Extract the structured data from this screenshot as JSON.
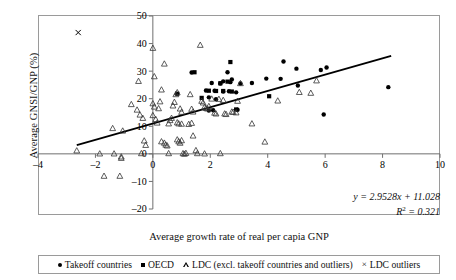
{
  "chart_data": {
    "type": "scatter",
    "title": "",
    "xlabel": "Average growth rate of real per capia GNP",
    "ylabel": "Average GNSI/GNP (%)",
    "xlim": [
      -4,
      10
    ],
    "ylim": [
      -20,
      50
    ],
    "xticks": [
      -4,
      -2,
      0,
      2,
      4,
      6,
      8,
      10
    ],
    "yticks": [
      -20,
      -10,
      0,
      10,
      20,
      30,
      40,
      50
    ],
    "xtick_labels": [
      "-4",
      "-2",
      "0",
      "2",
      "4",
      "6",
      "8",
      "10"
    ],
    "ytick_labels": [
      "-20",
      "-10",
      "0",
      "10",
      "20",
      "30",
      "40",
      "50"
    ],
    "grid": false,
    "legend_position": "below-plot",
    "annotations": {
      "equation": "y = 2.9528x + 11.028",
      "r_squared_label": "R",
      "r_squared_exp": "2",
      "r_squared_value": "= 0.321"
    },
    "trendline": {
      "slope": 2.9528,
      "intercept": 11.028,
      "x_start": -2.65,
      "x_end": 8.3
    },
    "series": [
      {
        "name": "Takeoff countries",
        "marker": "circle",
        "points": [
          [
            2.75,
            27.0
          ],
          [
            3.05,
            25.5
          ],
          [
            3.45,
            25.7
          ],
          [
            3.95,
            27.3
          ],
          [
            4.55,
            33.5
          ],
          [
            5.0,
            30.9
          ],
          [
            5.05,
            24.8
          ],
          [
            5.85,
            30.4
          ],
          [
            6.05,
            31.3
          ],
          [
            5.95,
            14.3
          ],
          [
            8.2,
            24.2
          ],
          [
            2.6,
            29.6
          ],
          [
            2.05,
            25.7
          ],
          [
            2.35,
            25.5
          ],
          [
            1.85,
            23.0
          ],
          [
            2.15,
            22.9
          ],
          [
            2.45,
            22.6
          ],
          [
            2.65,
            22.7
          ],
          [
            2.9,
            22.3
          ],
          [
            2.45,
            26.3
          ],
          [
            2.7,
            26.0
          ],
          [
            1.95,
            20.5
          ],
          [
            2.2,
            19.8
          ],
          [
            2.1,
            15.8
          ],
          [
            1.95,
            15.7
          ],
          [
            2.95,
            16.0
          ],
          [
            1.35,
            29.5
          ],
          [
            4.45,
            27.2
          ]
        ]
      },
      {
        "name": "OECD",
        "marker": "square",
        "points": [
          [
            2.7,
            33.3
          ],
          [
            1.45,
            29.6
          ],
          [
            0.85,
            21.8
          ],
          [
            1.7,
            20.3
          ],
          [
            4.05,
            20.9
          ],
          [
            2.9,
            16.1
          ],
          [
            2.45,
            22.8
          ],
          [
            2.75,
            22.6
          ],
          [
            1.95,
            22.9
          ],
          [
            2.2,
            22.8
          ],
          [
            2.35,
            25.6
          ],
          [
            2.6,
            26.2
          ]
        ]
      },
      {
        "name": "LDC (excl. takeoff countries and outliers)",
        "marker": "triangle",
        "points": [
          [
            -2.65,
            1.2
          ],
          [
            -1.85,
            0.1
          ],
          [
            -1.4,
            9.3
          ],
          [
            -1.35,
            0.1
          ],
          [
            -1.1,
            -1.5
          ],
          [
            -1.1,
            -1.0
          ],
          [
            -1.05,
            8.4
          ],
          [
            -1.15,
            -8.0
          ],
          [
            -1.7,
            -8.0
          ],
          [
            -0.35,
            13.0
          ],
          [
            -0.5,
            26.4
          ],
          [
            -0.75,
            18.0
          ],
          [
            -0.55,
            16.0
          ],
          [
            -0.45,
            14.2
          ],
          [
            -0.3,
            4.8
          ],
          [
            -0.25,
            3.2
          ],
          [
            -0.4,
            0.2
          ],
          [
            0.0,
            38.4
          ],
          [
            0.05,
            28.1
          ],
          [
            0.0,
            18.3
          ],
          [
            0.05,
            17.1
          ],
          [
            0.0,
            14.0
          ],
          [
            0.1,
            12.6
          ],
          [
            0.15,
            11.3
          ],
          [
            0.2,
            16.5
          ],
          [
            0.25,
            19.0
          ],
          [
            0.3,
            23.3
          ],
          [
            0.4,
            32.7
          ],
          [
            0.3,
            4.5
          ],
          [
            0.4,
            4.0
          ],
          [
            0.45,
            3.3
          ],
          [
            0.5,
            3.0
          ],
          [
            0.55,
            11.0
          ],
          [
            0.6,
            12.2
          ],
          [
            0.65,
            13.0
          ],
          [
            0.7,
            17.5
          ],
          [
            0.75,
            18.8
          ],
          [
            0.8,
            21.6
          ],
          [
            0.85,
            22.3
          ],
          [
            0.95,
            16.4
          ],
          [
            1.0,
            15.2
          ],
          [
            0.85,
            11.4
          ],
          [
            0.9,
            11.0
          ],
          [
            1.0,
            10.9
          ],
          [
            0.85,
            5.2
          ],
          [
            0.9,
            4.5
          ],
          [
            0.95,
            4.0
          ],
          [
            1.0,
            4.9
          ],
          [
            1.05,
            0.2
          ],
          [
            1.1,
            0.0
          ],
          [
            1.15,
            0.3
          ],
          [
            1.3,
            21.6
          ],
          [
            1.35,
            16.3
          ],
          [
            1.4,
            15.3
          ],
          [
            1.35,
            11.2
          ],
          [
            1.4,
            6.6
          ],
          [
            1.5,
            1.3
          ],
          [
            1.55,
            0.2
          ],
          [
            1.65,
            39.5
          ],
          [
            1.7,
            19.2
          ],
          [
            1.75,
            18.6
          ],
          [
            1.8,
            17.0
          ],
          [
            1.85,
            16.6
          ],
          [
            1.9,
            16.4
          ],
          [
            1.95,
            17.3
          ],
          [
            1.8,
            0.1
          ],
          [
            2.05,
            20.0
          ],
          [
            2.15,
            14.9
          ],
          [
            2.2,
            14.6
          ],
          [
            2.3,
            19.9
          ],
          [
            2.45,
            19.5
          ],
          [
            2.5,
            14.6
          ],
          [
            2.55,
            14.4
          ],
          [
            2.35,
            0.2
          ],
          [
            2.8,
            15.2
          ],
          [
            2.9,
            15.0
          ],
          [
            2.95,
            19.2
          ],
          [
            3.05,
            25.6
          ],
          [
            3.45,
            11.0
          ],
          [
            3.9,
            4.4
          ],
          [
            4.35,
            19.3
          ],
          [
            5.1,
            22.4
          ],
          [
            5.5,
            22.1
          ],
          [
            5.7,
            26.6
          ],
          [
            2.75,
            15.3
          ],
          [
            1.25,
            10.8
          ],
          [
            0.55,
            0.2
          ]
        ]
      },
      {
        "name": "LDC outliers",
        "marker": "cross",
        "points": [
          [
            -2.6,
            44.0
          ]
        ]
      }
    ]
  },
  "legend": {
    "items": [
      {
        "marker": "circle",
        "label": "Takeoff countries"
      },
      {
        "marker": "square",
        "label": "OECD"
      },
      {
        "marker": "triangle",
        "label": "LDC (excl. takeoff countries and outliers)"
      },
      {
        "marker": "cross",
        "label": "LDC outliers"
      }
    ]
  }
}
